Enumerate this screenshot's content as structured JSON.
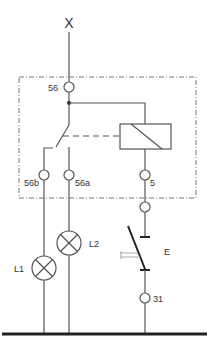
{
  "diagram": {
    "type": "electrical-schematic",
    "supply_label": "X",
    "terminals": {
      "t56": "56",
      "t56b": "56b",
      "t56a": "56a",
      "t5": "5",
      "t31": "31"
    },
    "lamps": {
      "l1": "L1",
      "l2": "L2"
    },
    "switch_label": "E",
    "colors": {
      "line": "#555555",
      "thick_line": "#222222",
      "dashed_box": "#777777",
      "background": "#ffffff"
    }
  }
}
